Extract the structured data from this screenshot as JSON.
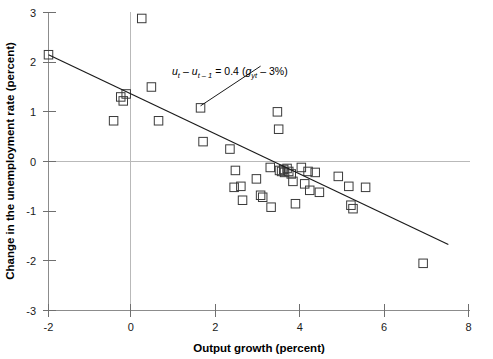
{
  "chart_data": {
    "type": "scatter",
    "title": "",
    "xlabel": "Output growth (percent)",
    "ylabel": "Change in the unemployment rate (percent)",
    "xlim": [
      -2,
      8
    ],
    "ylim": [
      -3,
      3
    ],
    "xticks": [
      "-2",
      "0",
      "2",
      "4",
      "6",
      "8"
    ],
    "xtick_values": [
      -2,
      0,
      2,
      4,
      6,
      8
    ],
    "yticks": [
      "3",
      "2",
      "1",
      "0",
      "-1",
      "-2",
      "-3"
    ],
    "ytick_values": [
      3,
      2,
      1,
      0,
      -1,
      -2,
      -3
    ],
    "grid": false,
    "zero_lines": true,
    "legend": "none",
    "marker": "open-square",
    "points": [
      {
        "x": -2.0,
        "y": 2.15
      },
      {
        "x": -0.45,
        "y": 0.82
      },
      {
        "x": -0.28,
        "y": 1.3
      },
      {
        "x": -0.22,
        "y": 1.22
      },
      {
        "x": -0.15,
        "y": 1.36
      },
      {
        "x": 0.22,
        "y": 2.88
      },
      {
        "x": 0.45,
        "y": 1.5
      },
      {
        "x": 0.62,
        "y": 0.82
      },
      {
        "x": 1.62,
        "y": 1.08
      },
      {
        "x": 1.68,
        "y": 0.4
      },
      {
        "x": 2.32,
        "y": 0.25
      },
      {
        "x": 2.42,
        "y": -0.52
      },
      {
        "x": 2.45,
        "y": -0.18
      },
      {
        "x": 2.58,
        "y": -0.5
      },
      {
        "x": 2.62,
        "y": -0.78
      },
      {
        "x": 2.95,
        "y": -0.35
      },
      {
        "x": 3.05,
        "y": -0.68
      },
      {
        "x": 3.1,
        "y": -0.72
      },
      {
        "x": 3.28,
        "y": -0.12
      },
      {
        "x": 3.3,
        "y": -0.92
      },
      {
        "x": 3.45,
        "y": 1.0
      },
      {
        "x": 3.48,
        "y": 0.65
      },
      {
        "x": 3.5,
        "y": -0.18
      },
      {
        "x": 3.55,
        "y": -0.2
      },
      {
        "x": 3.6,
        "y": -0.16
      },
      {
        "x": 3.62,
        "y": -0.22
      },
      {
        "x": 3.68,
        "y": -0.14
      },
      {
        "x": 3.72,
        "y": -0.2
      },
      {
        "x": 3.78,
        "y": -0.25
      },
      {
        "x": 3.82,
        "y": -0.4
      },
      {
        "x": 3.88,
        "y": -0.85
      },
      {
        "x": 4.02,
        "y": -0.12
      },
      {
        "x": 4.1,
        "y": -0.45
      },
      {
        "x": 4.18,
        "y": -0.2
      },
      {
        "x": 4.22,
        "y": -0.58
      },
      {
        "x": 4.35,
        "y": -0.22
      },
      {
        "x": 4.45,
        "y": -0.62
      },
      {
        "x": 4.9,
        "y": -0.3
      },
      {
        "x": 5.15,
        "y": -0.5
      },
      {
        "x": 5.2,
        "y": -0.88
      },
      {
        "x": 5.25,
        "y": -0.95
      },
      {
        "x": 5.55,
        "y": -0.52
      },
      {
        "x": 6.92,
        "y": -2.05
      }
    ],
    "fit_line": {
      "x0": -2.0,
      "y0": 2.15,
      "x1": 7.52,
      "y1": -1.67,
      "slope": -0.4,
      "intercept": 1.35
    },
    "annotation": {
      "equation_parts": {
        "u_t": "u",
        "sub_t": "t",
        "minus": "–",
        "u_t_prev": "u",
        "sub_t_prev": "t – 1",
        "equals": "=",
        "coefficient": "0.4",
        "open_paren": "(",
        "g": "g",
        "sub_yt": "yt",
        "minus2": "–",
        "three_pct": "3%",
        "close_paren": ")"
      },
      "plain_text": "u_t – u_(t–1) = 0.4 (g_yt – 3%)",
      "leader_from": {
        "x": 1.62,
        "y": 1.12
      },
      "leader_to": {
        "x": 3.05,
        "y": 1.92
      }
    }
  }
}
